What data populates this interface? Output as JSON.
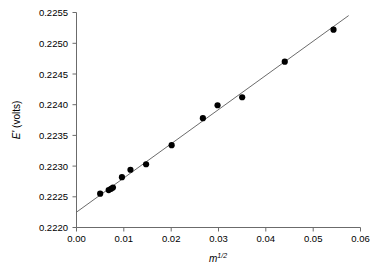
{
  "chart_data": {
    "type": "scatter",
    "title": "",
    "xlabel": "m^1/2",
    "xlabel_base": "m",
    "xlabel_sup": "1/2",
    "ylabel": "E' (volts)",
    "ylabel_symbol": "E'",
    "ylabel_unit": "(volts)",
    "xlim": [
      0.0,
      0.06
    ],
    "ylim": [
      0.222,
      0.2255
    ],
    "xticks": [
      0.0,
      0.01,
      0.02,
      0.03,
      0.04,
      0.05,
      0.06
    ],
    "xtick_labels": [
      "0.00",
      "0.01",
      "0.02",
      "0.03",
      "0.04",
      "0.05",
      "0.06"
    ],
    "yticks": [
      0.222,
      0.2225,
      0.223,
      0.2235,
      0.224,
      0.2245,
      0.225,
      0.2255
    ],
    "ytick_labels": [
      "0.2220",
      "0.2225",
      "0.2230",
      "0.2235",
      "0.2240",
      "0.2245",
      "0.2250",
      "0.2255"
    ],
    "grid": false,
    "legend": "none",
    "tick_direction": "out",
    "series": [
      {
        "name": "measured",
        "marker": "filled-circle",
        "marker_color": "#000000",
        "points": [
          {
            "x": 0.005,
            "y": 0.22255
          },
          {
            "x": 0.0068,
            "y": 0.22261
          },
          {
            "x": 0.0073,
            "y": 0.22263
          },
          {
            "x": 0.0077,
            "y": 0.22265
          },
          {
            "x": 0.0096,
            "y": 0.22282
          },
          {
            "x": 0.0114,
            "y": 0.22294
          },
          {
            "x": 0.0147,
            "y": 0.22303
          },
          {
            "x": 0.0201,
            "y": 0.22334
          },
          {
            "x": 0.0267,
            "y": 0.22378
          },
          {
            "x": 0.0298,
            "y": 0.22399
          },
          {
            "x": 0.035,
            "y": 0.22412
          },
          {
            "x": 0.044,
            "y": 0.2247
          },
          {
            "x": 0.0543,
            "y": 0.22522
          }
        ]
      },
      {
        "name": "linear-fit",
        "marker": "none",
        "line_color": "#5a5a5a",
        "endpoints": [
          {
            "x": 0.0,
            "y": 0.22225
          },
          {
            "x": 0.0575,
            "y": 0.22545
          }
        ]
      }
    ]
  },
  "caption": {
    "text": ""
  }
}
